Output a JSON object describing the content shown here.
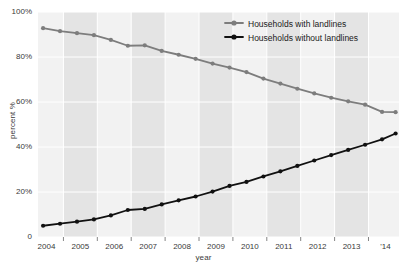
{
  "chart_data": {
    "type": "line",
    "title": "",
    "xlabel": "year",
    "ylabel": "percent %",
    "xlim": [
      2003.75,
      2014.4
    ],
    "ylim": [
      0,
      100
    ],
    "grid": true,
    "legend_position": "top-right",
    "x_tick_labels": [
      "2004",
      "2005",
      "2006",
      "2007",
      "2008",
      "2009",
      "2010",
      "2011",
      "2012",
      "2013",
      "'14"
    ],
    "x_tick_values": [
      2004,
      2005,
      2006,
      2007,
      2008,
      2009,
      2010,
      2011,
      2012,
      2013,
      2014
    ],
    "y_tick_labels": [
      "0",
      "20%",
      "40%",
      "60%",
      "80%",
      "100%"
    ],
    "y_tick_values": [
      0,
      20,
      40,
      60,
      80,
      100
    ],
    "x": [
      2003.9,
      2004.4,
      2004.9,
      2005.4,
      2005.9,
      2006.4,
      2006.9,
      2007.4,
      2007.9,
      2008.4,
      2008.9,
      2009.4,
      2009.9,
      2010.4,
      2010.9,
      2011.4,
      2011.9,
      2012.4,
      2012.9,
      2013.4,
      2013.9,
      2014.3
    ],
    "series": [
      {
        "name": "Households with landlines",
        "color": "#7d7d7d",
        "marker": "circle",
        "values": [
          92.8,
          91.5,
          90.6,
          89.7,
          87.6,
          85.0,
          85.2,
          82.7,
          81.0,
          79.2,
          77.1,
          75.3,
          73.3,
          70.4,
          68.2,
          65.9,
          63.8,
          61.9,
          60.3,
          58.8,
          55.6,
          55.5
        ]
      },
      {
        "name": "Households without landlines",
        "color": "#111111",
        "marker": "circle",
        "values": [
          5.0,
          5.9,
          6.8,
          7.8,
          9.6,
          12.0,
          12.5,
          14.5,
          16.3,
          18.0,
          20.2,
          22.7,
          24.5,
          26.9,
          29.2,
          31.6,
          34.0,
          36.4,
          38.7,
          41.0,
          43.4,
          46.0
        ]
      }
    ]
  },
  "legend": {
    "items": [
      {
        "label": "Households with landlines",
        "color": "#7d7d7d"
      },
      {
        "label": "Households without landlines",
        "color": "#111111"
      }
    ]
  },
  "style": {
    "band_light": "#f2f2f2",
    "band_dark": "#e4e4e4",
    "gridline_color": "#ffffff",
    "text_color": "#3a3a3a",
    "plot_background": "#f2f2f2"
  }
}
